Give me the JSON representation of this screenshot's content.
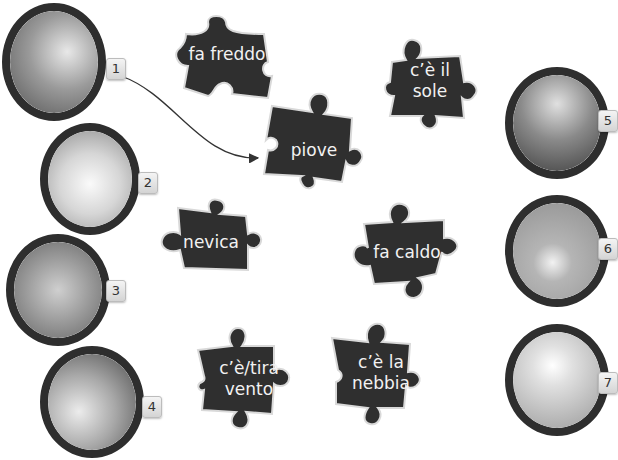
{
  "exercise": {
    "photos": [
      {
        "number": "1",
        "depicts": "woman with umbrella in rain",
        "tone": "#7d7d7d"
      },
      {
        "number": "2",
        "depicts": "snowy tree-lined road",
        "tone": "#d9d9d9"
      },
      {
        "number": "3",
        "depicts": "woman fanning herself in heat",
        "tone": "#9a9a9a"
      },
      {
        "number": "4",
        "depicts": "man in beanie blowing on cold hands",
        "tone": "#a5a5a5"
      },
      {
        "number": "5",
        "depicts": "wheat stalks bent in wind",
        "tone": "#8a8a8a"
      },
      {
        "number": "6",
        "depicts": "car headlights in fog",
        "tone": "#b8b8b8"
      },
      {
        "number": "7",
        "depicts": "sun shining through clouds",
        "tone": "#d0d0d0"
      }
    ],
    "pieces": [
      {
        "id": "fa-freddo",
        "text": "fa freddo"
      },
      {
        "id": "ce-il-sole",
        "text": "c’è il\nsole"
      },
      {
        "id": "piove",
        "text": "piove"
      },
      {
        "id": "nevica",
        "text": "nevica"
      },
      {
        "id": "fa-caldo",
        "text": "fa caldo"
      },
      {
        "id": "ce-tira-vento",
        "text": "c’è/tira\nvento"
      },
      {
        "id": "ce-la-nebbia",
        "text": "c’è la\nnebbia"
      }
    ],
    "example_match": {
      "from": "1",
      "to": "piove"
    },
    "colors": {
      "piece_fill": "#2f2f2f",
      "piece_edge": "#d9d9d9",
      "ring": "#2e2e2e",
      "line": "#333333"
    }
  }
}
